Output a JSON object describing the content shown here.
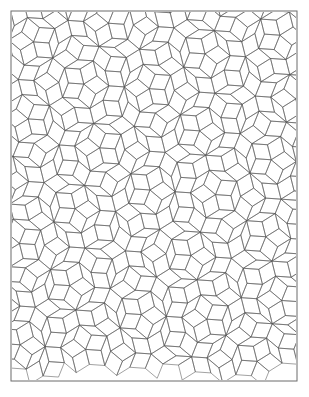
{
  "document": {
    "title": "Penrose Rhombic Tiling Plate",
    "page_background": "#ffffff",
    "width": 309,
    "height": 397
  },
  "frame": {
    "name": "page-border",
    "x": 11,
    "y": 11,
    "width": 286,
    "height": 370,
    "stroke_color": "#6b6b6b",
    "stroke_width": 1,
    "fill": "none"
  },
  "figure": {
    "caption": "",
    "pattern_name": "Penrose P3 rhombic tiling",
    "tile_types": [
      "fat rhomb (72/108 degrees)",
      "thin rhomb (36/144 degrees)"
    ],
    "symmetry": "5-fold / 10-fold quasiperiodic",
    "line_color": "#555555",
    "line_width": 0.55,
    "fill_color": "none",
    "edge_length": 15.5,
    "rotation_degrees": 4,
    "center_x": 150,
    "center_y": 190,
    "clip_x": 12,
    "clip_y": 12,
    "clip_width": 284,
    "clip_height": 368,
    "bottom_margin_blank": 18,
    "grid_lines_per_family": 13,
    "families": 5,
    "offsets": [
      0.12,
      0.2,
      0.22,
      0.18,
      0.28
    ]
  },
  "chart_data": {
    "type": "diagram",
    "elements": [
      {
        "name": "fat-rhomb",
        "angles_deg": [
          72,
          108
        ],
        "edge": 15.5
      },
      {
        "name": "thin-rhomb",
        "angles_deg": [
          36,
          144
        ],
        "edge": 15.5
      }
    ],
    "vertex_motifs": [
      "sun",
      "star",
      "ace",
      "deuce",
      "jack",
      "queen",
      "king"
    ],
    "legend": [],
    "grid": false
  }
}
